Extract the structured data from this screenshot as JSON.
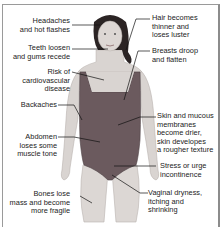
{
  "diagram": {
    "labels_left": [
      {
        "id": "headaches",
        "lines": [
          "Headaches",
          "and hot flashes"
        ]
      },
      {
        "id": "teeth",
        "lines": [
          "Teeth loosen",
          "and gums recede"
        ]
      },
      {
        "id": "cardio",
        "lines": [
          "Risk of",
          "cardiovascular",
          "disease"
        ]
      },
      {
        "id": "backaches",
        "lines": [
          "Backaches"
        ]
      },
      {
        "id": "abdomen",
        "lines": [
          "Abdomen",
          "loses some",
          "muscle tone"
        ]
      },
      {
        "id": "bones",
        "lines": [
          "Bones lose",
          "mass and become",
          "more fragile"
        ]
      }
    ],
    "labels_right": [
      {
        "id": "hair",
        "lines": [
          "Hair becomes",
          "thinner and",
          "loses luster"
        ]
      },
      {
        "id": "breasts",
        "lines": [
          "Breasts droop",
          "and flatten"
        ]
      },
      {
        "id": "skin",
        "lines": [
          "Skin and mucous",
          "membranes",
          "become drier,",
          "skin developes",
          "a rougher texture"
        ]
      },
      {
        "id": "incontinence",
        "lines": [
          "Stress or urge",
          "incontinence"
        ]
      },
      {
        "id": "vaginal",
        "lines": [
          "Vaginal dryness,",
          "itching and",
          "shrinking"
        ]
      }
    ],
    "colors": {
      "swimsuit": "#6b5a5e",
      "skin": "#d9d4d1",
      "hair": "#2b2424",
      "leader_line": "#111111",
      "frame": "#8c8c8c"
    }
  }
}
